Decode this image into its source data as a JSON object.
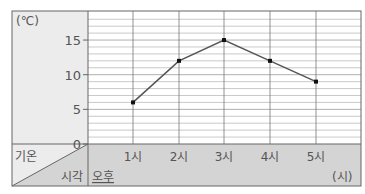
{
  "chart_data": {
    "type": "line",
    "title": "",
    "unit_label": "(℃)",
    "xlabel": "시각",
    "ylabel": "기온",
    "x_prefix": "오후",
    "x_unit": "(시)",
    "categories": [
      "1시",
      "2시",
      "3시",
      "4시",
      "5시"
    ],
    "values": [
      6,
      12,
      15,
      12,
      9
    ],
    "y_ticks": [
      "15",
      "10",
      "5",
      "0"
    ],
    "ylim": [
      0,
      17
    ],
    "grid": true,
    "grid_step": 1,
    "line_color": "#555555",
    "header_bg": "#d4d4d4",
    "axis_panel_bg": "#ececec"
  }
}
